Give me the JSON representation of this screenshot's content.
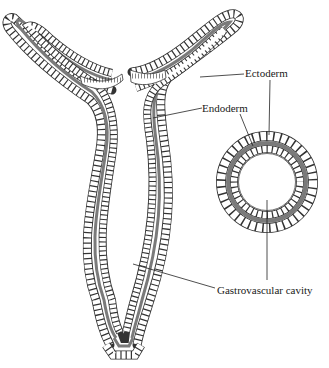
{
  "figure": {
    "type": "biology-diagram",
    "colors": {
      "background": "#ffffff",
      "outline": "#333333",
      "mesoglea": "#7a7a7a",
      "text": "#1a1a1a"
    }
  },
  "labels": {
    "ectoderm": "Ectoderm",
    "endoderm": "Endoderm",
    "cavity": "Gastrovascular cavity"
  },
  "views": [
    {
      "name": "longitudinal-section"
    },
    {
      "name": "cross-section"
    }
  ]
}
